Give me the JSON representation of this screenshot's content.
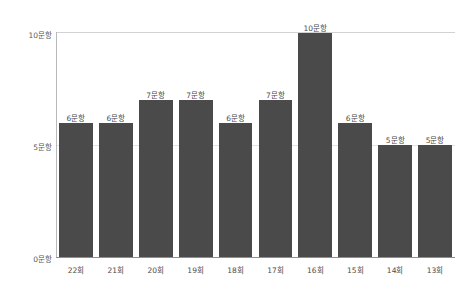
{
  "chart_data": {
    "type": "bar",
    "title": "",
    "subtitle": "",
    "xlabel": "",
    "ylabel": "",
    "categories": [
      "22회",
      "21회",
      "20회",
      "19회",
      "18회",
      "17회",
      "16회",
      "15회",
      "14회",
      "13회"
    ],
    "values": [
      6,
      6,
      7,
      7,
      6,
      7,
      10,
      6,
      5,
      5
    ],
    "data_labels": [
      "6문항",
      "6문항",
      "7문항",
      "7문항",
      "6문항",
      "7문항",
      "10문항",
      "6문항",
      "5문항",
      "5문항"
    ],
    "series": [
      {
        "name": "문항 수",
        "values": [
          6,
          6,
          7,
          7,
          6,
          7,
          10,
          6,
          5,
          5
        ]
      }
    ],
    "ylim": [
      0,
      10
    ],
    "ytick_values": [
      0,
      5,
      10
    ],
    "ytick_labels": [
      "0문항",
      "5문항",
      "10문항"
    ],
    "grid": true,
    "grid_axis": "y",
    "legend": false,
    "legend_position": "none",
    "bar_color": "#4a4a4a",
    "gridline_color": "#dcdcdc",
    "axis_color": "#8f8f8f",
    "label_color": "#4b4b4d",
    "background_color": "#ffffff",
    "annotations": []
  }
}
